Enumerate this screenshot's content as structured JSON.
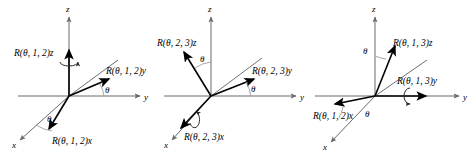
{
  "figure": {
    "background_color": "#ffffff",
    "axis_color": "#666a6d",
    "vector_color": "#000000",
    "width": 474,
    "height": 158
  },
  "panels": [
    {
      "id": "panel-1",
      "rotation": "R(θ, 1, 2)",
      "fixed_axis": "z",
      "axes": {
        "x": "x",
        "y": "y",
        "z": "z"
      },
      "labels": {
        "z_vector": "R(θ, 1, 2)z",
        "y_vector": "R(θ, 1, 2)y",
        "x_vector": "R(θ, 1, 2)x"
      },
      "angles": {
        "theta_upper": "θ",
        "theta_lower": "θ"
      },
      "curl_about": "z"
    },
    {
      "id": "panel-2",
      "rotation": "R(θ, 2, 3)",
      "fixed_axis": "x",
      "axes": {
        "x": "x",
        "y": "y",
        "z": "z"
      },
      "labels": {
        "z_vector": "R(θ, 2, 3)z",
        "y_vector": "R(θ, 2, 3)y",
        "x_vector": "R(θ, 2, 3)x"
      },
      "angles": {
        "theta_upper": "θ",
        "theta_lower": "θ"
      },
      "curl_about": "x"
    },
    {
      "id": "panel-3",
      "rotation": "R(θ, 1, 3)",
      "fixed_axis": "y",
      "axes": {
        "x": "x",
        "y": "y",
        "z": "z"
      },
      "labels": {
        "z_vector": "R(θ, 1, 3)z",
        "y_vector": "R(θ, 1, 3)y",
        "x_vector": "R(θ, 1, 2)x"
      },
      "angles": {
        "theta_upper": "θ",
        "theta_lower": "θ"
      },
      "curl_about": "y"
    }
  ]
}
